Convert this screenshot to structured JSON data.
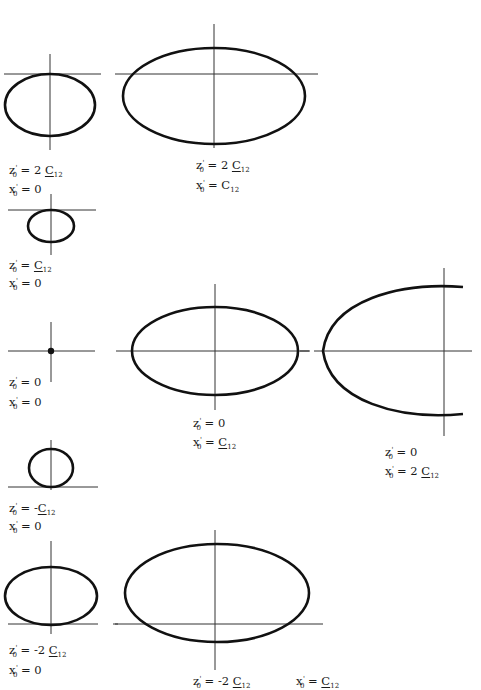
{
  "figure": {
    "stroke_color": "#111111",
    "axis_color": "#333333",
    "panels": [
      {
        "id": "p1",
        "z0": "2 C12",
        "x0": "0",
        "z_label": "z'0 = 2 C12",
        "x_label": "x'0 = 0",
        "shape": "ellipse-tangent-above"
      },
      {
        "id": "p2",
        "z0": "2 C12",
        "x0": "C12",
        "z_label": "z'0 = 2 C12",
        "x_label": "x'0 = C12",
        "shape": "wide-ellipse"
      },
      {
        "id": "p3",
        "z0": "C12",
        "x0": "0",
        "z_label": "z'0 = C12",
        "x_label": "x'0 = 0",
        "shape": "small-ellipse-tangent-above"
      },
      {
        "id": "p4",
        "z0": "0",
        "x0": "0",
        "z_label": "z'0 = 0",
        "x_label": "x'0 = 0",
        "shape": "point"
      },
      {
        "id": "p5",
        "z0": "0",
        "x0": "C12",
        "z_label": "z'0 = 0",
        "x_label": "x'0 = C12",
        "shape": "centered-ellipse"
      },
      {
        "id": "p6",
        "z0": "0",
        "x0": "2 C12",
        "z_label": "z'0 = 0",
        "x_label": "x'0 = 2 C12",
        "shape": "open-arc"
      },
      {
        "id": "p7",
        "z0": "-C12",
        "x0": "0",
        "z_label": "z'0 = -C12",
        "x_label": "x'0 = 0",
        "shape": "small-ellipse-tangent-below"
      },
      {
        "id": "p8",
        "z0": "-2 C12",
        "x0": "0",
        "z_label": "z'0 = -2 C12",
        "x_label": "x'0 = 0",
        "shape": "ellipse-tangent-below"
      },
      {
        "id": "p9",
        "z0": "-2 C12",
        "x0": "C12",
        "z_label": "z'0 = -2 C12",
        "x_label": "x'0 = C12",
        "shape": "wide-ellipse-below"
      }
    ]
  },
  "labels": {
    "z": "z",
    "x": "x",
    "prime": "'",
    "sub0": "0",
    "eq": " = ",
    "C": "C",
    "sub12": "12",
    "zero": "0",
    "two": "2 ",
    "minus": "-",
    "minus_two": "-2 "
  }
}
